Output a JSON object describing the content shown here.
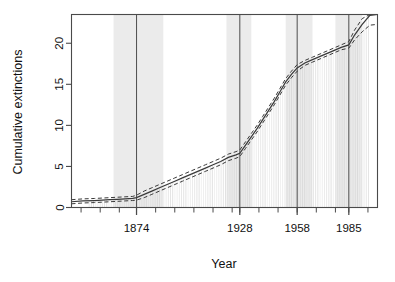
{
  "chart_data": {
    "type": "line",
    "title": "",
    "subtitle": "",
    "xlabel": "Year",
    "ylabel": "Cumulative extinctions",
    "grid": false,
    "legend": null,
    "xlim": [
      1840,
      2000
    ],
    "ylim": [
      0,
      23.5
    ],
    "xticks_labeled": [
      1874,
      1928,
      1958,
      1985
    ],
    "xtick_labels": [
      "1874",
      "1928",
      "1958",
      "1985"
    ],
    "xticks_minor": [
      1845,
      1855,
      1865,
      1874,
      1884,
      1894,
      1904,
      1914,
      1924,
      1928,
      1938,
      1948,
      1958,
      1968,
      1978,
      1985,
      1995
    ],
    "yticks": [
      0,
      5,
      10,
      15,
      20
    ],
    "ytick_labels": [
      "0",
      "5",
      "10",
      "15",
      "20"
    ],
    "annotations": {
      "vertical_reference_lines": [
        1874,
        1928,
        1958,
        1985
      ],
      "shaded_bands": [
        {
          "from": 1862,
          "to": 1888
        },
        {
          "from": 1921,
          "to": 1934
        },
        {
          "from": 1952,
          "to": 1966
        },
        {
          "from": 1978,
          "to": 1992
        }
      ]
    },
    "series": [
      {
        "name": "Cumulative extinctions (estimate)",
        "style": "solid-step",
        "x": [
          1840,
          1846,
          1852,
          1856,
          1860,
          1864,
          1868,
          1872,
          1874,
          1878,
          1882,
          1886,
          1890,
          1894,
          1898,
          1902,
          1906,
          1910,
          1914,
          1918,
          1922,
          1926,
          1928,
          1931,
          1934,
          1937,
          1940,
          1943,
          1946,
          1949,
          1952,
          1955,
          1958,
          1962,
          1966,
          1970,
          1974,
          1978,
          1981,
          1985,
          1988,
          1992,
          1996,
          2000
        ],
        "values": [
          0.7,
          0.8,
          0.85,
          0.9,
          0.95,
          1.0,
          1.05,
          1.1,
          1.2,
          1.6,
          2.0,
          2.4,
          2.8,
          3.2,
          3.6,
          4.0,
          4.4,
          4.8,
          5.2,
          5.6,
          6.1,
          6.4,
          6.6,
          7.6,
          8.6,
          9.6,
          10.7,
          11.8,
          12.9,
          14.1,
          15.3,
          16.2,
          17.0,
          17.6,
          18.0,
          18.4,
          18.8,
          19.2,
          19.5,
          19.8,
          21.0,
          22.3,
          23.4,
          23.5
        ]
      },
      {
        "name": "Upper confidence band",
        "style": "dashed",
        "x": [
          1840,
          1846,
          1852,
          1856,
          1860,
          1864,
          1868,
          1872,
          1874,
          1878,
          1882,
          1886,
          1890,
          1894,
          1898,
          1902,
          1906,
          1910,
          1914,
          1918,
          1922,
          1926,
          1928,
          1931,
          1934,
          1937,
          1940,
          1943,
          1946,
          1949,
          1952,
          1955,
          1958,
          1962,
          1966,
          1970,
          1974,
          1978,
          1981,
          1985,
          1988,
          1992,
          1996,
          2000
        ],
        "values": [
          0.95,
          1.05,
          1.1,
          1.15,
          1.2,
          1.25,
          1.3,
          1.35,
          1.5,
          2.0,
          2.4,
          2.8,
          3.2,
          3.6,
          4.0,
          4.4,
          4.8,
          5.2,
          5.6,
          6.0,
          6.5,
          6.8,
          7.0,
          8.0,
          9.0,
          10.0,
          11.1,
          12.2,
          13.3,
          14.5,
          15.7,
          16.6,
          17.4,
          17.9,
          18.3,
          18.7,
          19.1,
          19.5,
          19.8,
          20.2,
          21.6,
          23.0,
          23.5,
          23.5
        ]
      },
      {
        "name": "Lower confidence band",
        "style": "dashed",
        "x": [
          1840,
          1846,
          1852,
          1856,
          1860,
          1864,
          1868,
          1872,
          1874,
          1878,
          1882,
          1886,
          1890,
          1894,
          1898,
          1902,
          1906,
          1910,
          1914,
          1918,
          1922,
          1926,
          1928,
          1931,
          1934,
          1937,
          1940,
          1943,
          1946,
          1949,
          1952,
          1955,
          1958,
          1962,
          1966,
          1970,
          1974,
          1978,
          1981,
          1985,
          1988,
          1992,
          1996,
          2000
        ],
        "values": [
          0.45,
          0.55,
          0.6,
          0.65,
          0.7,
          0.75,
          0.8,
          0.85,
          0.9,
          1.2,
          1.6,
          2.0,
          2.4,
          2.8,
          3.2,
          3.6,
          4.0,
          4.4,
          4.8,
          5.2,
          5.7,
          6.0,
          6.2,
          7.2,
          8.2,
          9.2,
          10.3,
          11.4,
          12.5,
          13.7,
          14.9,
          15.8,
          16.6,
          17.3,
          17.7,
          18.1,
          18.5,
          18.9,
          19.2,
          19.4,
          20.4,
          21.4,
          22.2,
          22.3
        ]
      }
    ],
    "rug_bars": {
      "description": "thin vertical stripe bars below the cumulative curve",
      "color": "#cfcfcf"
    }
  },
  "colors": {
    "background": "#ffffff",
    "axis": "#4a4a4a",
    "curve": "#3a3a3a",
    "band_fill": "#e8e8e8",
    "rug": "#d2d2d2",
    "reference_line": "#555555",
    "text": "#111111"
  },
  "axis_labels": {
    "x_title": "Year",
    "y_title": "Cumulative extinctions"
  }
}
